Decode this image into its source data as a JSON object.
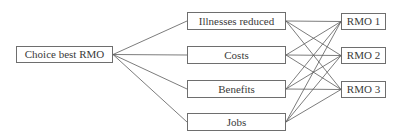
{
  "diagram": {
    "type": "decision-hierarchy",
    "goal": {
      "id": "goal",
      "label": "Choice best RMO",
      "box": {
        "x": 16,
        "y": 46,
        "w": 97,
        "h": 17
      }
    },
    "criteria": [
      {
        "id": "illnesses",
        "label": "Illnesses reduced",
        "box": {
          "x": 187,
          "y": 12,
          "w": 99,
          "h": 18
        }
      },
      {
        "id": "costs",
        "label": "Costs",
        "box": {
          "x": 187,
          "y": 46,
          "w": 99,
          "h": 18
        }
      },
      {
        "id": "benefits",
        "label": "Benefits",
        "box": {
          "x": 187,
          "y": 80,
          "w": 99,
          "h": 18
        }
      },
      {
        "id": "jobs",
        "label": "Jobs",
        "box": {
          "x": 187,
          "y": 113,
          "w": 99,
          "h": 18
        }
      }
    ],
    "alternatives": [
      {
        "id": "rmo1",
        "label": "RMO 1",
        "box": {
          "x": 341,
          "y": 13,
          "w": 45,
          "h": 17
        }
      },
      {
        "id": "rmo2",
        "label": "RMO 2",
        "box": {
          "x": 341,
          "y": 47,
          "w": 45,
          "h": 17
        }
      },
      {
        "id": "rmo3",
        "label": "RMO 3",
        "box": {
          "x": 341,
          "y": 81,
          "w": 45,
          "h": 17
        }
      }
    ],
    "edges": [
      {
        "from": "goal",
        "to": "illnesses"
      },
      {
        "from": "goal",
        "to": "costs"
      },
      {
        "from": "goal",
        "to": "benefits"
      },
      {
        "from": "goal",
        "to": "jobs"
      },
      {
        "from": "illnesses",
        "to": "rmo1"
      },
      {
        "from": "illnesses",
        "to": "rmo2"
      },
      {
        "from": "illnesses",
        "to": "rmo3"
      },
      {
        "from": "costs",
        "to": "rmo1"
      },
      {
        "from": "costs",
        "to": "rmo2"
      },
      {
        "from": "costs",
        "to": "rmo3"
      },
      {
        "from": "benefits",
        "to": "rmo1"
      },
      {
        "from": "benefits",
        "to": "rmo2"
      },
      {
        "from": "benefits",
        "to": "rmo3"
      },
      {
        "from": "jobs",
        "to": "rmo1"
      },
      {
        "from": "jobs",
        "to": "rmo2"
      },
      {
        "from": "jobs",
        "to": "rmo3"
      }
    ],
    "colors": {
      "border": "#6e6e6e",
      "line": "#5a5a5a",
      "text": "#3a3a3a",
      "background": "#ffffff"
    }
  }
}
